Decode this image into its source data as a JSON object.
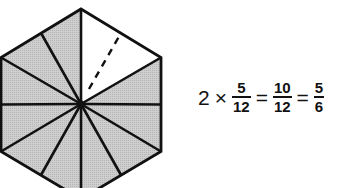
{
  "figure": {
    "shape": "regular hexagon",
    "divisions": 12,
    "unshaded_parts": 2,
    "shaded_parts": 10,
    "shade_color": "#c8c8c8",
    "line_color": "#111111",
    "dashed_line": "from center to midpoint of upper-right edge"
  },
  "equation": {
    "multiplier": "2",
    "times": "×",
    "frac1": {
      "num": "5",
      "den": "12"
    },
    "eq1": "=",
    "frac2": {
      "num": "10",
      "den": "12"
    },
    "eq2": "=",
    "frac3": {
      "num": "5",
      "den": "6"
    }
  }
}
